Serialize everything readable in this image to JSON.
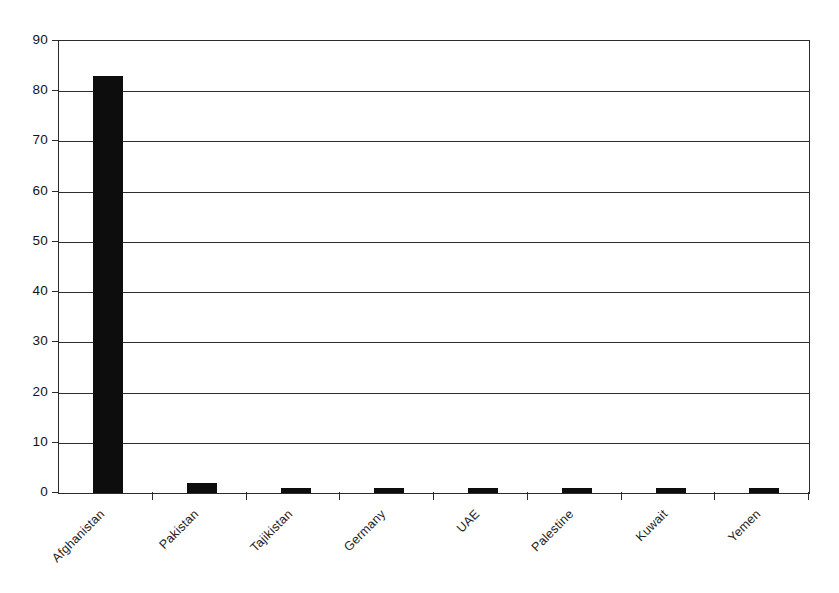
{
  "chart_data": {
    "type": "bar",
    "title": "",
    "subtitle": "",
    "xlabel": "",
    "ylabel": "",
    "categories": [
      "Afghanistan",
      "Pakistan",
      "Tajikistan",
      "Germany",
      "UAE",
      "Palestine",
      "Kuwait",
      "Yemen"
    ],
    "values": [
      83,
      2,
      1,
      1,
      1,
      1,
      1,
      1
    ],
    "ylim": [
      0,
      90
    ],
    "ytick_step": 10,
    "yticks": [
      0,
      10,
      20,
      30,
      40,
      50,
      60,
      70,
      80,
      90
    ],
    "ytick_labels": [
      "0",
      "10",
      "20",
      "30",
      "40",
      "50",
      "60",
      "70",
      "80",
      "90"
    ],
    "grid": true,
    "grid_axis": "y",
    "legend": false,
    "legend_position": "none",
    "bar_color": "#0d0d0d",
    "axis_color": "#2b2b2b",
    "background_color": "#ffffff",
    "xtick_label_rotation": -45,
    "annotations": []
  }
}
